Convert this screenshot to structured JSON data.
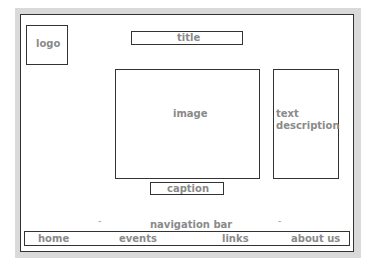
{
  "wireframe": {
    "logo": "logo",
    "title": "title",
    "image": "image",
    "text_description": "text description",
    "caption": "caption",
    "navigation_bar_label": "navigation bar",
    "nav_items": [
      "home",
      "events",
      "links",
      "about us"
    ],
    "dash_left": "-",
    "dash_right": "-"
  }
}
